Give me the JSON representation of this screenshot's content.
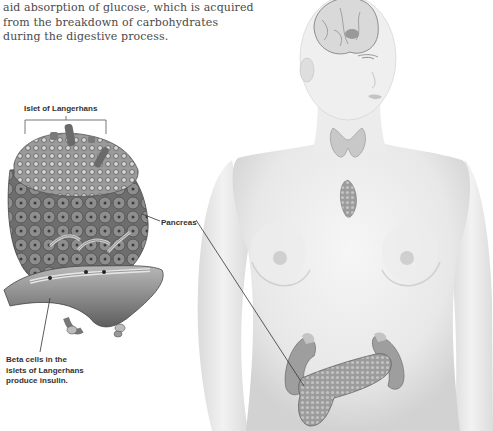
{
  "body_text": {
    "lines": [
      "aid absorption of glucose, which is acquired",
      "from the breakdown of carbohydrates",
      "during the digestive process."
    ]
  },
  "labels": {
    "islet": "Islet of Langerhans",
    "pancreas": "Pancreas",
    "beta_cells": [
      "Beta cells in the",
      "islets of Langerhans",
      "produce insulin."
    ]
  },
  "figure": {
    "subjects": [
      "islet-of-langerhans-detail",
      "female-torso-endocrine-system",
      "brain",
      "thyroid",
      "thymus",
      "pancreas",
      "kidneys"
    ],
    "colors": {
      "skin": "#ececec",
      "skin_shadow": "#d4d4d4",
      "tissue": "#8a8a8a",
      "tissue_dark": "#555555",
      "leader_line": "#333333",
      "text": "#4a4a4a"
    }
  }
}
